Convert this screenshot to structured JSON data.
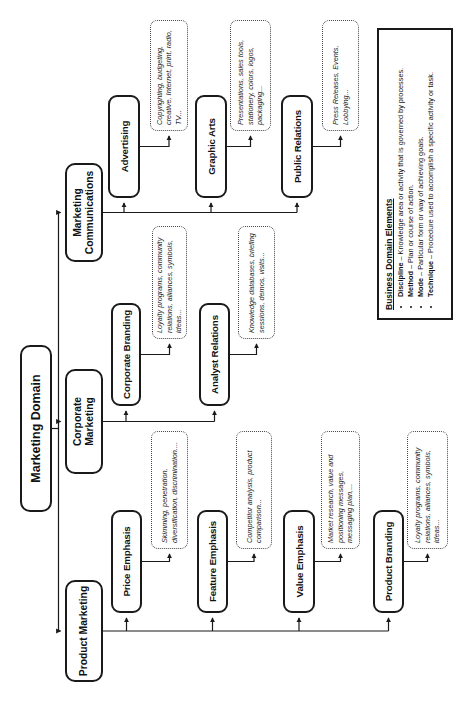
{
  "root": {
    "label": "Marketing Domain"
  },
  "branches": [
    {
      "label": "Product Marketing",
      "children": [
        {
          "label": "Price Emphasis",
          "note": "Skimming, penetration, diversification, discrimination...."
        },
        {
          "label": "Feature Emphasis",
          "note": "Competitor analysis, product comparison..."
        },
        {
          "label": "Value Emphasis",
          "note": "Market research, value and positioning messages, messaging plan,..."
        },
        {
          "label": "Product Branding",
          "note": "Loyalty programs, community relations, alliances, symbols, ideas..."
        }
      ]
    },
    {
      "label": "Corporate Marketing",
      "children": [
        {
          "label": "Corporate Branding",
          "note": "Loyalty programs, community relations, alliances, symbols, ideas..."
        },
        {
          "label": "Analyst Relations",
          "note": "Knowledge databases, briefing sessions, demos, visits..."
        }
      ]
    },
    {
      "label": "Marketing Communications",
      "children": [
        {
          "label": "Advertising",
          "note": "Copyrighting, budgeting, creative, Internet, print, radio, TV..."
        },
        {
          "label": "Graphic Arts",
          "note": "Presentations, sales tools, stationery, colors, logos, packaging..."
        },
        {
          "label": "Public Relations",
          "note": "Press Releases, Events, Lobbying..."
        }
      ]
    }
  ],
  "legend": {
    "title": "Business Domain Elements",
    "items": [
      {
        "term": "Discipline",
        "definition": "– Knowledge area or activity that is governed by processes."
      },
      {
        "term": "Method",
        "definition": "– Plan or course of action."
      },
      {
        "term": "Mode",
        "definition": "– Particular form or way of achieving goals."
      },
      {
        "term": "Technique",
        "definition": "– Procedure used to accomplish a specific activity or task."
      }
    ]
  },
  "colors": {
    "ink": "#1a1a1a",
    "background": "#ffffff"
  }
}
